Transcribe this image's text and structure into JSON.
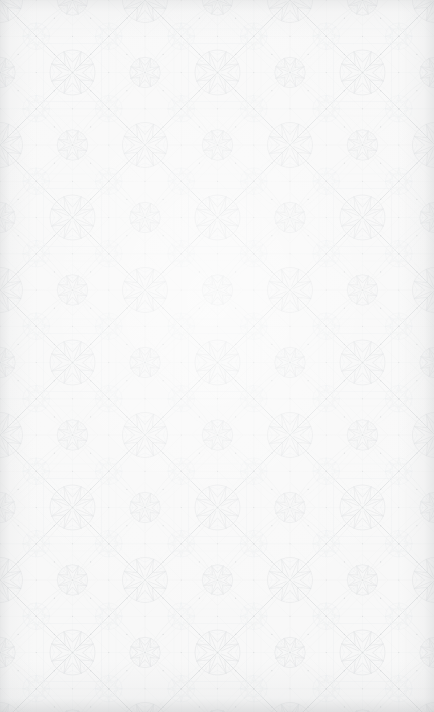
{
  "image": {
    "kind": "decorative-background",
    "description": "Seamless arabesque geometric lattice pattern",
    "width": 434,
    "height": 712,
    "has_text": false,
    "has_ui_controls": false
  },
  "pattern": {
    "style": "islamic-arabesque-lattice",
    "tile_width": 145,
    "tile_height": 145,
    "lattice_angle_degrees": 45,
    "motifs": [
      "diagonal-lattice-diamond",
      "eight-pointed-star-rosette",
      "interlaced-circular-arc",
      "petal-leaf-scroll",
      "small-node-dot"
    ]
  },
  "colors": {
    "background": "#f8f8f8",
    "paper_base": "#fafafa",
    "line_primary": "#e2e4e5",
    "line_secondary": "#eceeef",
    "line_faint": "#f1f2f3",
    "node_dot": "#d8dadc",
    "vignette_edge": "#c4c6c8"
  },
  "stroke": {
    "lattice_width": 0.9,
    "motif_width": 0.55,
    "detail_width": 0.4
  }
}
